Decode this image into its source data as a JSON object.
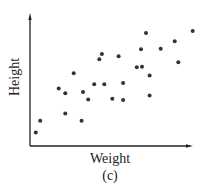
{
  "chart_data": {
    "type": "scatter",
    "title": "",
    "xlabel": "Weight",
    "ylabel": "Height",
    "caption": "(c)",
    "xlim": [
      0,
      100
    ],
    "ylim": [
      0,
      100
    ],
    "grid": false,
    "legend": null,
    "ticks": false,
    "point_color": "#333333",
    "axis_color": "#222222",
    "points": [
      {
        "x": 3.5,
        "y": 10.2
      },
      {
        "x": 6.2,
        "y": 19.3
      },
      {
        "x": 17.4,
        "y": 44.0
      },
      {
        "x": 21.4,
        "y": 40.2
      },
      {
        "x": 21.4,
        "y": 24.7
      },
      {
        "x": 26.5,
        "y": 55.5
      },
      {
        "x": 31.3,
        "y": 19.3
      },
      {
        "x": 32.1,
        "y": 41.2
      },
      {
        "x": 35.3,
        "y": 35.6
      },
      {
        "x": 38.9,
        "y": 47.1
      },
      {
        "x": 42.0,
        "y": 66.2
      },
      {
        "x": 43.6,
        "y": 70.2
      },
      {
        "x": 45.0,
        "y": 47.1
      },
      {
        "x": 49.9,
        "y": 36.1
      },
      {
        "x": 53.7,
        "y": 68.5
      },
      {
        "x": 56.4,
        "y": 48.1
      },
      {
        "x": 56.4,
        "y": 35.1
      },
      {
        "x": 64.7,
        "y": 60.1
      },
      {
        "x": 67.9,
        "y": 60.5
      },
      {
        "x": 67.3,
        "y": 73.8
      },
      {
        "x": 70.3,
        "y": 86.3
      },
      {
        "x": 72.5,
        "y": 53.9
      },
      {
        "x": 72.5,
        "y": 38.5
      },
      {
        "x": 79.2,
        "y": 74.3
      },
      {
        "x": 87.7,
        "y": 79.9
      },
      {
        "x": 89.9,
        "y": 63.9
      },
      {
        "x": 98.6,
        "y": 87.8
      }
    ]
  }
}
